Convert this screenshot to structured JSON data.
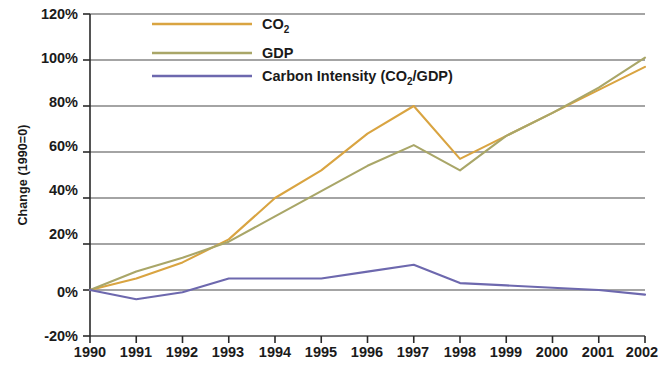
{
  "chart_data": {
    "type": "line",
    "title": "",
    "subtitle": "",
    "xlabel": "",
    "ylabel": "Change (1990=0)",
    "x": [
      1990,
      1991,
      1992,
      1993,
      1994,
      1995,
      1996,
      1997,
      1998,
      1999,
      2000,
      2001,
      2002
    ],
    "categories": [
      "1990",
      "1991",
      "1992",
      "1993",
      "1994",
      "1995",
      "1996",
      "1997",
      "1998",
      "1999",
      "2000",
      "2001",
      "2002"
    ],
    "xlim": [
      1990,
      2002
    ],
    "ylim": [
      -20,
      120
    ],
    "ytick_values": [
      -20,
      0,
      20,
      40,
      60,
      80,
      100,
      120
    ],
    "ytick_labels": [
      "-20%",
      "0%",
      "20%",
      "40%",
      "60%",
      "80%",
      "100%",
      "120%"
    ],
    "grid": "horizontal",
    "legend_position": "top-left-inside",
    "series": [
      {
        "name": "CO₂",
        "legend_label": "CO2",
        "color": "#d9a441",
        "values": [
          0,
          5,
          12,
          22,
          40,
          52,
          68,
          80,
          57,
          67,
          77,
          87,
          97
        ]
      },
      {
        "name": "GDP",
        "legend_label": "GDP",
        "color": "#a9a668",
        "values": [
          0,
          8,
          14,
          21,
          32,
          43,
          54,
          63,
          52,
          67,
          77,
          88,
          101
        ]
      },
      {
        "name": "Carbon Intensity (CO₂/GDP)",
        "legend_label": "Carbon Intensity (CO2/GDP)",
        "color": "#6d68ae",
        "values": [
          0,
          -4,
          -1,
          5,
          5,
          5,
          8,
          11,
          3,
          2,
          1,
          0,
          -2
        ]
      }
    ]
  },
  "legend": {
    "items": [
      {
        "label_main": "CO",
        "label_sub": "2",
        "label_tail": "",
        "color": "#d9a441"
      },
      {
        "label_main": "GDP",
        "label_sub": "",
        "label_tail": "",
        "color": "#a9a668"
      },
      {
        "label_main": "Carbon Intensity (CO",
        "label_sub": "2",
        "label_tail": "/GDP)",
        "color": "#6d68ae"
      }
    ]
  },
  "axes": {
    "y_title": "Change (1990=0)",
    "y_labels": [
      "120%",
      "100%",
      "80%",
      "60%",
      "40%",
      "20%",
      "0%",
      "-20%"
    ],
    "x_labels": [
      "1990",
      "1991",
      "1992",
      "1993",
      "1994",
      "1995",
      "1996",
      "1997",
      "1998",
      "1999",
      "2000",
      "2001",
      "2002"
    ]
  },
  "colors": {
    "co2": "#d9a441",
    "gdp": "#a9a668",
    "intensity": "#6d68ae",
    "axis": "#2a2a2a",
    "grid": "#4a4a4a",
    "background": "#ffffff"
  }
}
